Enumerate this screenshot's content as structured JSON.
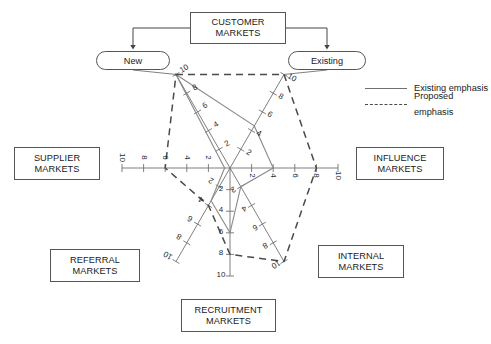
{
  "title_box": {
    "line1": "CUSTOMER",
    "line2": "MARKETS"
  },
  "branches": [
    {
      "name": "new",
      "label": "New"
    },
    {
      "name": "existing",
      "label": "Existing"
    }
  ],
  "market_boxes": [
    {
      "name": "supplier-markets",
      "line1": "SUPPLIER",
      "line2": "MARKETS"
    },
    {
      "name": "influence-markets",
      "line1": "INFLUENCE",
      "line2": "MARKETS"
    },
    {
      "name": "referral-markets",
      "line1": "REFERRAL",
      "line2": "MARKETS"
    },
    {
      "name": "internal-markets",
      "line1": "INTERNAL",
      "line2": "MARKETS"
    },
    {
      "name": "recruitment-markets",
      "line1": "RECRUITMENT",
      "line2": "MARKETS"
    }
  ],
  "legend": [
    {
      "name": "existing-emphasis",
      "label": "Existing emphasis",
      "style": "solid",
      "color": "#6f6f6f"
    },
    {
      "name": "proposed-emphasis",
      "label": "Proposed emphasis",
      "style": "dashed",
      "color": "#4a4a4a"
    }
  ],
  "chart_data": {
    "type": "radar",
    "axis_max": 10,
    "tick_values": [
      2,
      4,
      6,
      8,
      10
    ],
    "axes": [
      {
        "name": "new",
        "label": "New",
        "angle_deg": 120
      },
      {
        "name": "existing",
        "label": "Existing",
        "angle_deg": 60
      },
      {
        "name": "influence",
        "label": "INFLUENCE MARKETS",
        "angle_deg": 0
      },
      {
        "name": "internal",
        "label": "INTERNAL MARKETS",
        "angle_deg": -60
      },
      {
        "name": "recruitment",
        "label": "RECRUITMENT MARKETS",
        "angle_deg": -90
      },
      {
        "name": "referral",
        "label": "REFERRAL MARKETS",
        "angle_deg": -120
      },
      {
        "name": "supplier",
        "label": "SUPPLIER MARKETS",
        "angle_deg": 180
      }
    ],
    "series": [
      {
        "name": "Existing emphasis",
        "style": "solid",
        "color": "#8a8a8a",
        "values": {
          "new": 10,
          "existing": 4.5,
          "influence": 4,
          "internal": 2,
          "recruitment": 6,
          "referral": 3.5,
          "supplier": 0.5
        }
      },
      {
        "name": "Proposed emphasis",
        "style": "dashed",
        "color": "#4a4a4a",
        "values": {
          "new": 10,
          "existing": 10,
          "influence": 8,
          "internal": 10,
          "recruitment": 8,
          "referral": 4,
          "supplier": 6
        }
      }
    ]
  }
}
